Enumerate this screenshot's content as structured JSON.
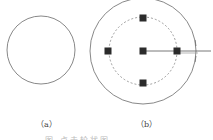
{
  "figure": {
    "labels": {
      "a": "（a）",
      "b": "（b）"
    },
    "caption": "图        点击轮状图"
  },
  "colors": {
    "stroke": "#6a6a6a",
    "square_fill": "#2b2b2b",
    "dashed": "#777777",
    "line": "#555555"
  },
  "diagram_a": {
    "circle": {
      "cx": 41,
      "cy": 50,
      "r": 34
    }
  },
  "diagram_b": {
    "outer_circle": {
      "cx": 143,
      "cy": 51,
      "r": 53
    },
    "dashed_circle": {
      "cx": 143,
      "cy": 51,
      "r": 34
    },
    "nodes": [
      {
        "id": "top",
        "x": 143,
        "y": 18
      },
      {
        "id": "left",
        "x": 108,
        "y": 51
      },
      {
        "id": "center",
        "x": 143,
        "y": 51
      },
      {
        "id": "right",
        "x": 177,
        "y": 51
      },
      {
        "id": "bottom",
        "x": 143,
        "y": 83
      }
    ],
    "pointer_line": {
      "x1": 143,
      "y1": 51,
      "x2": 211,
      "y2": 51
    }
  }
}
